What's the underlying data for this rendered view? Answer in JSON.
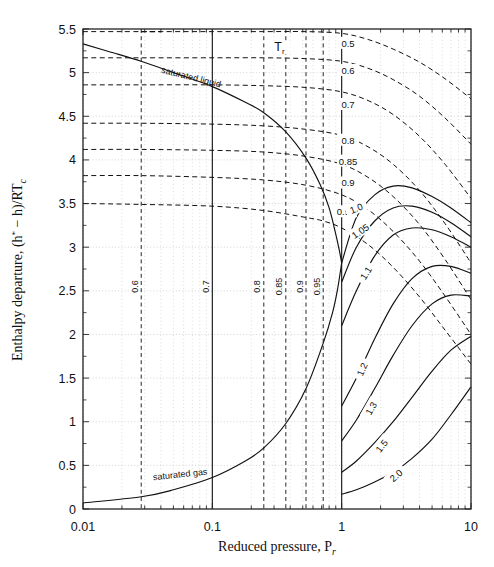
{
  "chart_data": {
    "type": "line",
    "title": "",
    "xlabel": "Reduced pressure, P",
    "xlabel_sub": "r",
    "ylabel": "Enthalpy departure, (h",
    "ylabel_sup": "*",
    "ylabel_mid": "− h)/RT",
    "ylabel_sub": "c",
    "xscale": "log",
    "xlim": [
      0.01,
      10
    ],
    "ylim": [
      0,
      5.5
    ],
    "xticks": [
      0.01,
      0.1,
      1,
      10
    ],
    "xtick_labels": [
      "0.01",
      "0.1",
      "1",
      "10"
    ],
    "yticks": [
      0,
      0.5,
      1,
      1.5,
      2,
      2.5,
      3,
      3.5,
      4,
      4.5,
      5,
      5.5
    ],
    "ytick_labels": [
      "0",
      "0.5",
      "1",
      "1.5",
      "2",
      "2.5",
      "3",
      "3.5",
      "4",
      "4.5",
      "5",
      "5.5"
    ],
    "grid": true,
    "legend_position": "inline-curve-labels",
    "legend_title": "T",
    "legend_title_sub": "r",
    "annotations": [
      {
        "name": "saturated-liquid",
        "text": "saturated liquid",
        "x": 0.04,
        "y": 5.0,
        "rotation": 14
      },
      {
        "name": "saturated-gas",
        "text": "saturated gas",
        "x": 0.035,
        "y": 0.33,
        "rotation": -6
      },
      {
        "name": "tr-legend",
        "text": "Tr",
        "x": 0.33,
        "y": 5.27
      }
    ],
    "saturation_pressure_lines": [
      {
        "label": "0.6",
        "pr": 0.0282,
        "style": "dashed",
        "label_y": 2.55
      },
      {
        "label": "0.7",
        "pr": 0.1,
        "style": "solid",
        "label_y": 2.55
      },
      {
        "label": "0.8",
        "pr": 0.25,
        "style": "dashed",
        "label_y": 2.55
      },
      {
        "label": "0.85",
        "pr": 0.37,
        "style": "dashed",
        "label_y": 2.55
      },
      {
        "label": "0.9",
        "pr": 0.53,
        "style": "dashed",
        "label_y": 2.55
      },
      {
        "label": "0.95",
        "pr": 0.72,
        "style": "dashed",
        "label_y": 2.55
      },
      {
        "label": "1.0",
        "pr": 1.0,
        "style": "solid",
        "label_y": null
      }
    ],
    "series": [
      {
        "name": "Tr = 0.5",
        "label": "0.5",
        "style": "dashed",
        "label_at": {
          "x": 1.12,
          "y": 5.33
        },
        "x": [
          0.01,
          0.02,
          0.04,
          0.0282,
          0.1,
          0.25,
          0.53,
          1.0,
          1.6,
          2.5,
          4.0,
          6.3,
          10.0
        ],
        "y": [
          5.47,
          5.47,
          5.47,
          5.47,
          5.47,
          5.47,
          5.47,
          5.45,
          5.38,
          5.27,
          5.12,
          4.93,
          4.7
        ]
      },
      {
        "name": "Tr = 0.6",
        "label": "0.6",
        "style": "dashed",
        "label_at": {
          "x": 1.12,
          "y": 5.02
        },
        "x": [
          0.01,
          0.0282,
          0.1,
          0.25,
          0.53,
          1.0,
          1.6,
          2.5,
          4.0,
          6.3,
          10.0
        ],
        "y": [
          5.17,
          5.17,
          5.17,
          5.17,
          5.16,
          5.13,
          5.05,
          4.92,
          4.73,
          4.48,
          4.18
        ]
      },
      {
        "name": "Tr = 0.7",
        "label": "0.7",
        "style": "dashed",
        "label_at": {
          "x": 1.12,
          "y": 4.63
        },
        "x": [
          0.01,
          0.0282,
          0.1,
          0.25,
          0.53,
          1.0,
          1.6,
          2.5,
          4.0,
          6.3,
          10.0
        ],
        "y": [
          4.86,
          4.86,
          4.86,
          4.85,
          4.83,
          4.78,
          4.68,
          4.52,
          4.27,
          3.95,
          3.56
        ]
      },
      {
        "name": "Tr = 0.8",
        "label": "0.8",
        "style": "dashed",
        "label_at": {
          "x": 1.12,
          "y": 4.22
        },
        "x": [
          0.01,
          0.0282,
          0.1,
          0.25,
          0.53,
          1.0,
          1.6,
          2.5,
          4.0,
          6.3,
          10.0
        ],
        "y": [
          4.42,
          4.42,
          4.41,
          4.39,
          4.35,
          4.28,
          4.15,
          3.95,
          3.65,
          3.27,
          2.82
        ]
      },
      {
        "name": "Tr = 0.85",
        "label": "0.85",
        "style": "dashed",
        "label_at": {
          "x": 1.12,
          "y": 3.98
        },
        "x": [
          0.01,
          0.0282,
          0.1,
          0.25,
          0.53,
          1.0,
          1.6,
          2.5,
          4.0,
          6.3,
          10.0
        ],
        "y": [
          4.12,
          4.12,
          4.11,
          4.09,
          4.04,
          3.95,
          3.8,
          3.58,
          3.26,
          2.86,
          2.4
        ]
      },
      {
        "name": "Tr = 0.9",
        "label": "0.9",
        "style": "dashed",
        "label_at": {
          "x": 1.12,
          "y": 3.73
        },
        "x": [
          0.01,
          0.0282,
          0.1,
          0.25,
          0.53,
          1.0,
          1.6,
          2.5,
          4.0,
          6.3,
          10.0
        ],
        "y": [
          3.82,
          3.82,
          3.8,
          3.77,
          3.71,
          3.6,
          3.43,
          3.18,
          2.84,
          2.44,
          2.0
        ]
      },
      {
        "name": "Tr = 0.95",
        "label": "0.95",
        "style": "dashed",
        "label_at": {
          "x": 1.08,
          "y": 3.4
        },
        "x": [
          0.01,
          0.0282,
          0.1,
          0.25,
          0.53,
          0.72,
          1.0,
          1.6,
          2.5,
          4.0,
          6.3,
          10.0
        ],
        "y": [
          3.5,
          3.49,
          3.47,
          3.42,
          3.34,
          3.3,
          3.22,
          3.03,
          2.77,
          2.43,
          2.05,
          1.66
        ]
      },
      {
        "name": "Tr = 1.0",
        "label": "1.0",
        "style": "solid",
        "label_at": {
          "x": 1.3,
          "y": 3.44
        },
        "x": [
          1.0,
          1.3,
          1.8,
          2.5,
          3.5,
          5.0,
          7.0,
          10.0
        ],
        "y": [
          2.82,
          3.34,
          3.6,
          3.7,
          3.68,
          3.58,
          3.45,
          3.28
        ]
      },
      {
        "name": "Tr = 1.05",
        "label": "1.05",
        "style": "solid",
        "label_at": {
          "x": 1.4,
          "y": 3.18
        },
        "x": [
          1.0,
          1.3,
          1.8,
          2.5,
          3.5,
          5.0,
          7.0,
          10.0
        ],
        "y": [
          2.6,
          3.0,
          3.3,
          3.45,
          3.47,
          3.4,
          3.28,
          3.12
        ]
      },
      {
        "name": "Tr = 1.1",
        "label": "1.1",
        "style": "solid",
        "label_at": {
          "x": 1.55,
          "y": 2.7
        },
        "x": [
          1.0,
          1.3,
          1.8,
          2.5,
          3.5,
          5.0,
          7.0,
          10.0
        ],
        "y": [
          2.1,
          2.5,
          2.9,
          3.14,
          3.22,
          3.2,
          3.12,
          3.0
        ]
      },
      {
        "name": "Tr = 1.2",
        "label": "1.2",
        "style": "solid",
        "label_at": {
          "x": 1.45,
          "y": 1.6
        },
        "x": [
          1.0,
          1.3,
          1.8,
          2.5,
          3.5,
          5.0,
          7.0,
          10.0
        ],
        "y": [
          1.18,
          1.5,
          1.95,
          2.35,
          2.64,
          2.78,
          2.78,
          2.7
        ]
      },
      {
        "name": "Tr = 1.3",
        "label": "1.3",
        "style": "solid",
        "label_at": {
          "x": 1.7,
          "y": 1.15
        },
        "x": [
          1.0,
          1.3,
          1.8,
          2.5,
          3.5,
          5.0,
          7.0,
          10.0
        ],
        "y": [
          0.78,
          1.02,
          1.38,
          1.76,
          2.1,
          2.35,
          2.45,
          2.44
        ]
      },
      {
        "name": "Tr = 1.5",
        "label": "1.5",
        "style": "solid",
        "label_at": {
          "x": 2.05,
          "y": 0.72
        },
        "x": [
          1.0,
          1.3,
          1.8,
          2.5,
          3.5,
          5.0,
          7.0,
          10.0
        ],
        "y": [
          0.42,
          0.55,
          0.76,
          1.0,
          1.28,
          1.58,
          1.82,
          1.98
        ]
      },
      {
        "name": "Tr = 2.0",
        "label": "2.0",
        "style": "solid",
        "label_at": {
          "x": 2.65,
          "y": 0.38
        },
        "x": [
          1.0,
          1.3,
          1.8,
          2.5,
          3.5,
          5.0,
          7.0,
          10.0
        ],
        "y": [
          0.17,
          0.22,
          0.31,
          0.42,
          0.58,
          0.8,
          1.08,
          1.4
        ]
      },
      {
        "name": "saturated liquid",
        "label": "saturated liquid",
        "style": "solid-sat",
        "x": [
          0.01,
          0.016,
          0.0282,
          0.05,
          0.1,
          0.18,
          0.25,
          0.37,
          0.53,
          0.68,
          0.8,
          0.9,
          0.96,
          1.0
        ],
        "y": [
          5.33,
          5.24,
          5.13,
          5.0,
          4.84,
          4.66,
          4.54,
          4.32,
          4.02,
          3.72,
          3.45,
          3.15,
          2.96,
          2.82
        ]
      },
      {
        "name": "saturated gas",
        "label": "saturated gas",
        "style": "solid-sat",
        "x": [
          0.01,
          0.0282,
          0.05,
          0.1,
          0.18,
          0.25,
          0.37,
          0.53,
          0.72,
          0.85,
          0.93,
          1.0
        ],
        "y": [
          0.07,
          0.14,
          0.22,
          0.36,
          0.55,
          0.7,
          0.98,
          1.38,
          1.9,
          2.25,
          2.52,
          2.82
        ]
      }
    ]
  },
  "axes": {
    "x_title_main": "Reduced pressure, P",
    "x_title_sub": "r",
    "y_title_a": "Enthalpy departure, (h",
    "y_title_star": "*",
    "y_title_b": "− h)/RT",
    "y_title_c": "c"
  }
}
